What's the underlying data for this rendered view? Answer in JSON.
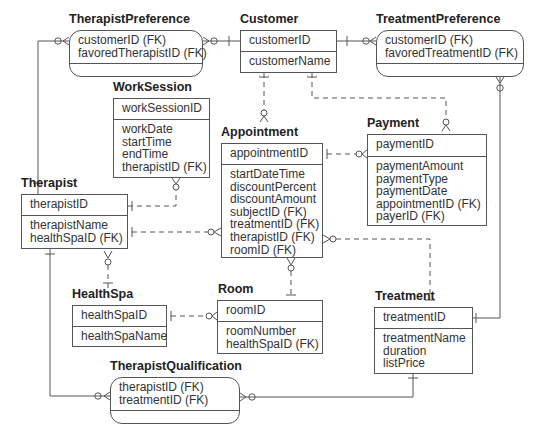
{
  "entities": {
    "therapist_preference": {
      "title": "TherapistPreference",
      "key": [
        "customerID (FK)",
        "favoredTherapistID (FK)"
      ],
      "attributes": []
    },
    "customer": {
      "title": "Customer",
      "key": [
        "customerID"
      ],
      "attributes": [
        "customerName"
      ]
    },
    "treatment_preference": {
      "title": "TreatmentPreference",
      "key": [
        "customerID (FK)",
        "favoredTreatmentID (FK)"
      ],
      "attributes": []
    },
    "work_session": {
      "title": "WorkSession",
      "key": [
        "workSessionID"
      ],
      "attributes": [
        "workDate",
        "startTime",
        "endTime",
        "therapistID (FK)"
      ]
    },
    "appointment": {
      "title": "Appointment",
      "key": [
        "appointmentID"
      ],
      "attributes": [
        "startDateTime",
        "discountPercent",
        "discountAmount",
        "subjectID (FK)",
        "treatmentID (FK)",
        "therapistID (FK)",
        "roomID (FK)"
      ]
    },
    "payment": {
      "title": "Payment",
      "key": [
        "paymentID"
      ],
      "attributes": [
        "paymentAmount",
        "paymentType",
        "paymentDate",
        "appointmentID (FK)",
        "payerID (FK)"
      ]
    },
    "therapist": {
      "title": "Therapist",
      "key": [
        "therapistID"
      ],
      "attributes": [
        "therapistName",
        "healthSpaID (FK)"
      ]
    },
    "health_spa": {
      "title": "HealthSpa",
      "key": [
        "healthSpaID"
      ],
      "attributes": [
        "healthSpaName"
      ]
    },
    "room": {
      "title": "Room",
      "key": [
        "roomID"
      ],
      "attributes": [
        "roomNumber",
        "healthSpaID (FK)"
      ]
    },
    "treatment": {
      "title": "Treatment",
      "key": [
        "treatmentID"
      ],
      "attributes": [
        "treatmentName",
        "duration",
        "listPrice"
      ]
    },
    "therapist_qualification": {
      "title": "TherapistQualification",
      "key": [
        "therapistID (FK)",
        "treatmentID (FK)"
      ],
      "attributes": []
    }
  },
  "colors": {
    "line": "#555555",
    "text": "#333333",
    "title": "#222222"
  }
}
